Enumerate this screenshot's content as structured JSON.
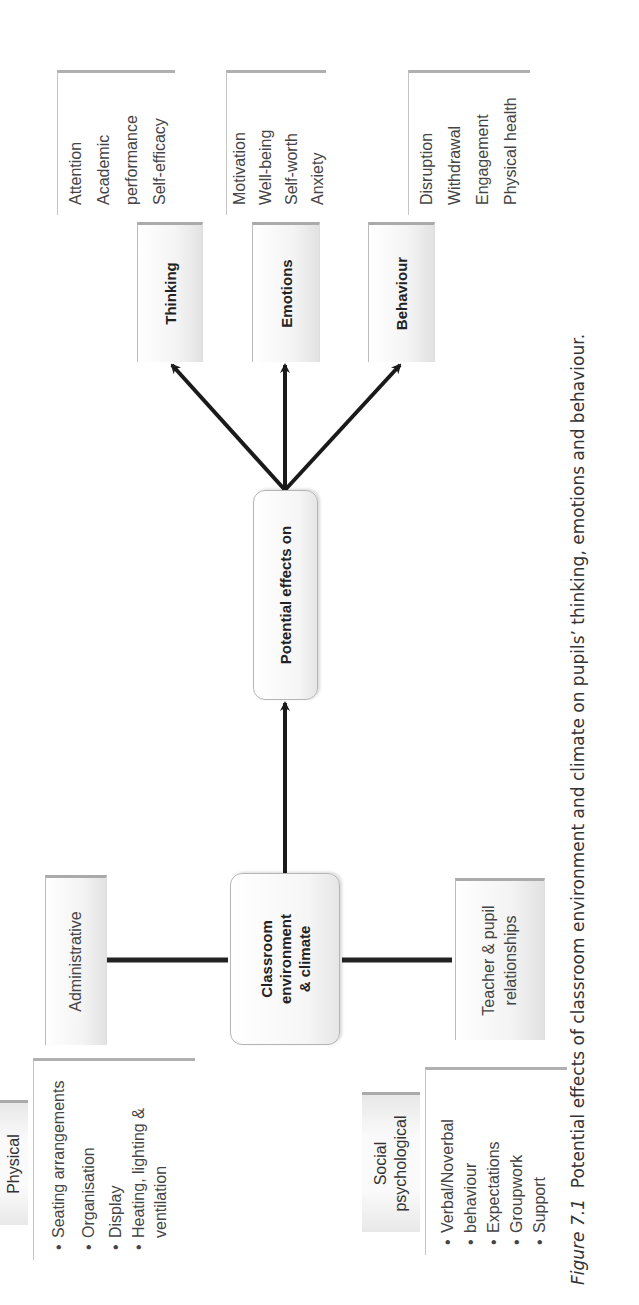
{
  "diagram": {
    "orientation": "rotated-90-ccw",
    "root": {
      "label": "Classroom environment & climate",
      "lines": [
        "Classroom",
        "environment",
        "& climate"
      ]
    },
    "middle": {
      "label": "Potential effects on"
    },
    "outcomes": [
      {
        "label": "Thinking",
        "details": [
          "Attention",
          "Academic",
          "performance",
          "Self-efficacy"
        ]
      },
      {
        "label": "Emotions",
        "details": [
          "Motivation",
          "Well-being",
          "Self-worth",
          "Anxiety"
        ]
      },
      {
        "label": "Behaviour",
        "details": [
          "Disruption",
          "Withdrawal",
          "Engagement",
          "Physical health"
        ]
      }
    ],
    "factors": {
      "administrative": {
        "label": "Administrative"
      },
      "physical": {
        "label": "Physical",
        "items": [
          "Seating arrangements",
          "Organisation",
          "Display",
          "Heating, lighting &",
          "ventilation"
        ]
      },
      "teacher_pupil": {
        "label": "Teacher & pupil relationships",
        "lines": [
          "Teacher & pupil",
          "relationships"
        ]
      },
      "social_psychological": {
        "label": "Social psychological",
        "lines": [
          "Social",
          "psychological"
        ],
        "items": [
          "Verbal/Noverbal",
          "behaviour",
          "Expectations",
          "Groupwork",
          "Support"
        ]
      }
    },
    "colors": {
      "arrow": "#1a1a1a",
      "box_border": "#aaaaaa",
      "text": "#333333"
    }
  },
  "caption": {
    "figure_label": "Figure 7.1",
    "text": "Potential effects of classroom environment and climate on pupils’ thinking, emotions and behaviour."
  }
}
